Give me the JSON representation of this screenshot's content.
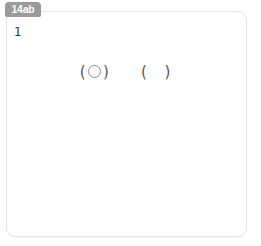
{
  "tab": {
    "label": "14ab",
    "color": "#9a9a9a",
    "text_color": "#ffffff"
  },
  "card": {
    "background": "#ffffff",
    "border_color": "#e3e3e3"
  },
  "style": {
    "grid_line_color": "#d9d9d9",
    "shape_stroke_color": "#8e8e8e",
    "number_color": "#3b3b3b"
  },
  "exercises": [
    {
      "number": "1",
      "type": "answer-parentheses",
      "left_paren_open": "(",
      "left_paren_close": ")",
      "right_paren_open": "(",
      "right_paren_close": ")",
      "left_content": "circle-glyph",
      "right_content": ""
    },
    {
      "number": "2",
      "type": "grid-shape",
      "shape_name": "triangle",
      "grid_cols": 5,
      "grid_rows": 5,
      "points": "23,45 0,23 45,0"
    },
    {
      "number": "3",
      "type": "grid-shape",
      "shape_name": "l-shape",
      "grid_cols": 5,
      "grid_rows": 5,
      "points": "6,6 39,6 39,28 50,28 50,45 6,45"
    },
    {
      "number": "4",
      "type": "grid-shape",
      "shape_name": "notched-banner",
      "grid_cols": 5,
      "grid_rows": 5,
      "points": "6,6 45,6 45,45 23,34 6,45"
    },
    {
      "number": "5",
      "type": "grid-shape",
      "shape_name": "staircase",
      "grid_cols": 5,
      "grid_rows": 5,
      "points": "6,6 45,6 45,45 28,45 28,28 17,28 17,17 6,17"
    },
    {
      "number": "6",
      "type": "grid-shape",
      "shape_name": "h-block",
      "grid_cols": 5,
      "grid_rows": 5,
      "points": "0,11 22,11 22,0 39,0 39,39 22,39 22,28 11,28 11,39 0,39"
    }
  ]
}
